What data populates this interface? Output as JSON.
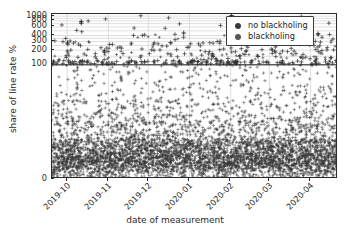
{
  "chart_data": {
    "type": "scatter",
    "title": "",
    "xlabel": "date of measurement",
    "ylabel": "share of line rate %",
    "grid": true,
    "legend_position": "upper right",
    "yscale": "symlog-like",
    "ylim": [
      0,
      1080
    ],
    "yticks": [
      0,
      100,
      200,
      300,
      400,
      600,
      800,
      1000
    ],
    "ytick_labels": [
      "0",
      "100",
      "200",
      "300",
      "400",
      "600",
      "800",
      "1000"
    ],
    "xlim": [
      "2019-09-20",
      "2020-04-22"
    ],
    "xticks": [
      "2019-10",
      "2019-11",
      "2019-12",
      "2020-01",
      "2020-02",
      "2020-03",
      "2020-04"
    ],
    "xtick_labels": [
      "2019-10",
      "2019-11",
      "2019-12",
      "2020-01",
      "2020-02",
      "2020-03",
      "2020-04"
    ],
    "reference_line": {
      "y": 100,
      "label": "100% line rate"
    },
    "marker": "+",
    "series": [
      {
        "name": "no blackholing",
        "color": "#3a3a3a",
        "n_points": 1750,
        "y_range": [
          2,
          1000
        ],
        "y_median": 62,
        "description": "scatter of measurements without blackholing, spread from near 0 to above 1000, dense below 100"
      },
      {
        "name": "blackholing",
        "color": "#555555",
        "n_points": 1450,
        "y_range": [
          1,
          420
        ],
        "y_median": 26,
        "description": "scatter of measurements with blackholing, concentrated in a dark dense band below 45"
      }
    ],
    "notable_outliers": [
      {
        "x": "2019-10-12",
        "y": 700,
        "series": "no blackholing"
      },
      {
        "x": "2019-10-12",
        "y": 760,
        "series": "no blackholing"
      },
      {
        "x": "2019-12-28",
        "y": 440,
        "series": "no blackholing"
      },
      {
        "x": "2020-02-02",
        "y": 1005,
        "series": "no blackholing"
      },
      {
        "x": "2020-02-01",
        "y": 790,
        "series": "no blackholing"
      },
      {
        "x": "2020-04-07",
        "y": 425,
        "series": "no blackholing"
      }
    ]
  },
  "legend": {
    "entries": [
      {
        "label": "no blackholing",
        "color": "#3a3a3a",
        "marker": "circle"
      },
      {
        "label": "blackholing",
        "color": "#555555",
        "marker": "circle"
      }
    ]
  }
}
